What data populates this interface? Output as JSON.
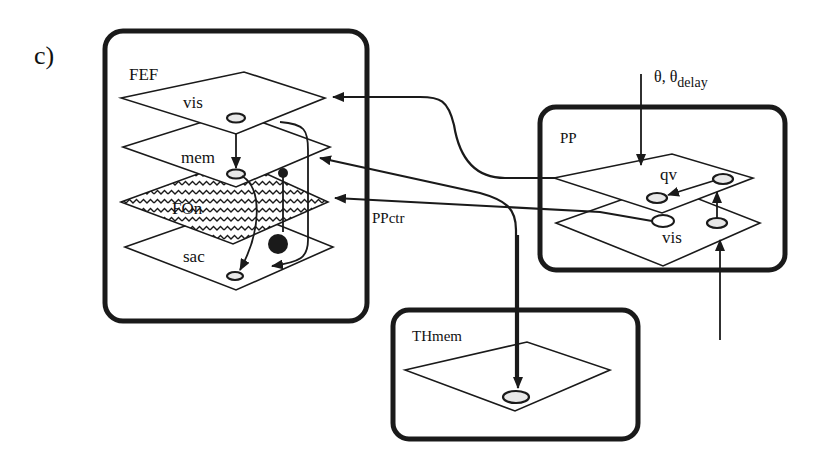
{
  "panel_label": "c)",
  "modules": {
    "fef": {
      "title": "FEF",
      "layers": [
        {
          "name": "vis",
          "style": "plain"
        },
        {
          "name": "mem",
          "style": "plain"
        },
        {
          "name": "FOn",
          "style": "wavy-hatched"
        },
        {
          "name": "sac",
          "style": "plain"
        }
      ]
    },
    "pp": {
      "title": "PP",
      "layers": [
        {
          "name": "qv",
          "style": "plain"
        },
        {
          "name": "vis",
          "style": "plain"
        }
      ]
    },
    "thmem": {
      "title": "THmem",
      "layers": [
        {
          "name": "",
          "style": "plain"
        }
      ]
    }
  },
  "connections": [
    {
      "from": "PP.qv",
      "to": "FEF.vis",
      "label": ""
    },
    {
      "from": "PP.vis",
      "to": "FEF.FOn",
      "label": "PPctr"
    },
    {
      "from": "THmem",
      "to": "FEF.mem",
      "label": ""
    },
    {
      "from": "FEF.mem",
      "to": "THmem",
      "label": ""
    },
    {
      "from": "FEF.vis",
      "to": "FEF.mem",
      "label": ""
    },
    {
      "from": "FEF.mem",
      "to": "FEF.sac",
      "label": ""
    },
    {
      "from": "FEF.vis",
      "to": "FEF.sac",
      "label": ""
    },
    {
      "from": "FEF.FOn",
      "to": "FEF.mem",
      "label": "inhibitory"
    },
    {
      "from": "FEF.FOn",
      "to": "FEF.sac",
      "label": "inhibitory"
    },
    {
      "from": "PP.qv",
      "to": "PP.qv",
      "label": ""
    },
    {
      "from": "PP.vis",
      "to": "PP.qv",
      "label": ""
    },
    {
      "from": "external",
      "to": "PP.vis",
      "label": ""
    }
  ],
  "inputs": {
    "theta_label": "θ, θ",
    "theta_subscript": "delay",
    "ppctr_label": "PPctr"
  }
}
